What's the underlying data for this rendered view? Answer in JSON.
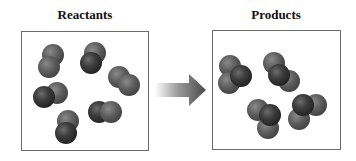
{
  "reactants": {
    "title": "Reactants",
    "molecules": [
      {
        "atoms": [
          {
            "x": 42,
            "y": 44,
            "shade": "light"
          },
          {
            "x": 38,
            "y": 56,
            "shade": "light"
          }
        ]
      },
      {
        "atoms": [
          {
            "x": 84,
            "y": 42,
            "shade": "light"
          },
          {
            "x": 80,
            "y": 52,
            "shade": "dark"
          }
        ]
      },
      {
        "atoms": [
          {
            "x": 108,
            "y": 66,
            "shade": "light"
          },
          {
            "x": 118,
            "y": 74,
            "shade": "light"
          }
        ]
      },
      {
        "atoms": [
          {
            "x": 46,
            "y": 82,
            "shade": "light"
          },
          {
            "x": 33,
            "y": 86,
            "shade": "dark"
          }
        ]
      },
      {
        "atoms": [
          {
            "x": 88,
            "y": 101,
            "shade": "dark"
          },
          {
            "x": 100,
            "y": 101,
            "shade": "light"
          }
        ]
      },
      {
        "atoms": [
          {
            "x": 57,
            "y": 110,
            "shade": "light"
          },
          {
            "x": 55,
            "y": 122,
            "shade": "dark"
          }
        ]
      }
    ]
  },
  "products": {
    "title": "Products",
    "molecules": [
      {
        "atoms": [
          {
            "x": 219,
            "y": 55,
            "shade": "light"
          },
          {
            "x": 218,
            "y": 72,
            "shade": "light"
          },
          {
            "x": 230,
            "y": 65,
            "shade": "dark"
          }
        ]
      },
      {
        "atoms": [
          {
            "x": 263,
            "y": 52,
            "shade": "light"
          },
          {
            "x": 278,
            "y": 70,
            "shade": "light"
          },
          {
            "x": 268,
            "y": 64,
            "shade": "dark"
          }
        ]
      },
      {
        "atoms": [
          {
            "x": 247,
            "y": 99,
            "shade": "light"
          },
          {
            "x": 257,
            "y": 117,
            "shade": "light"
          },
          {
            "x": 259,
            "y": 104,
            "shade": "dark"
          }
        ]
      },
      {
        "atoms": [
          {
            "x": 305,
            "y": 94,
            "shade": "light"
          },
          {
            "x": 288,
            "y": 108,
            "shade": "light"
          },
          {
            "x": 292,
            "y": 94,
            "shade": "dark"
          }
        ]
      }
    ]
  },
  "arrow": {
    "direction": "right",
    "meaning": "reaction"
  }
}
